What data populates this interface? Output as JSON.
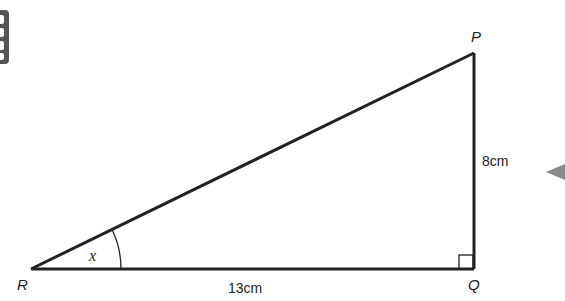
{
  "diagram": {
    "type": "right-triangle",
    "vertices": {
      "R": {
        "label": "R",
        "x": 31,
        "y": 269
      },
      "Q": {
        "label": "Q",
        "x": 474,
        "y": 269
      },
      "P": {
        "label": "P",
        "x": 474,
        "y": 53
      }
    },
    "sides": {
      "RQ": {
        "label": "13cm"
      },
      "QP": {
        "label": "8cm"
      }
    },
    "angle": {
      "vertex": "R",
      "label": "x"
    },
    "right_angle_at": "Q",
    "colors": {
      "line": "#222222",
      "pointer": "#8a8a8a",
      "icon": "#555555"
    }
  }
}
